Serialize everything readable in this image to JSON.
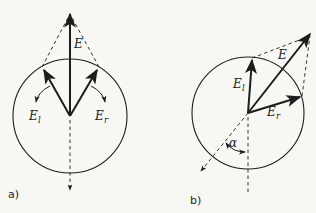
{
  "figure": {
    "background_color": "#f7f7f4",
    "ink_color": "#1d1d1d",
    "panels": [
      {
        "caption": "a)",
        "labels": {
          "resultant": "E",
          "left_base": "E",
          "left_sub": "l",
          "right_base": "E",
          "right_sub": "r"
        }
      },
      {
        "caption": "b)",
        "labels": {
          "resultant": "E",
          "left_base": "E",
          "left_sub": "l",
          "right_base": "E",
          "right_sub": "r",
          "angle": "α"
        }
      }
    ]
  }
}
